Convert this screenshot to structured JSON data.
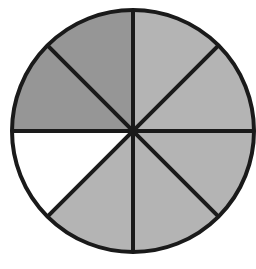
{
  "figure": {
    "kind": "fraction-circle",
    "background_color": "#ffffff"
  },
  "geometry": {
    "canvas_width": 256,
    "canvas_height": 269,
    "center_x": 133,
    "center_y": 131,
    "radius": 121,
    "outline_color": "#1a1a1a",
    "outline_width": 4,
    "divider_color": "#1a1a1a",
    "divider_width": 4,
    "sector_count": 8,
    "sector_angle_degrees": 45
  },
  "palette": {
    "dark_gray": "#969696",
    "light_gray": "#b4b4b4",
    "white": "#ffffff",
    "line_black": "#1a1a1a"
  },
  "chart_data": {
    "type": "pie",
    "xlabel": "",
    "ylabel": "",
    "legend": "none",
    "grid": false,
    "total_sectors": 8,
    "shaded_sectors": 7,
    "unshaded_sectors": 1,
    "fraction_shaded": "7/8",
    "categories": [
      "sector-1",
      "sector-2",
      "sector-3",
      "sector-4",
      "sector-5",
      "sector-6",
      "sector-7",
      "sector-8"
    ],
    "values": [
      45,
      45,
      45,
      45,
      45,
      45,
      45,
      45
    ],
    "sectors": [
      {
        "id": "sector-1",
        "label": "top-right-upper",
        "start_angle": 0,
        "end_angle": 45,
        "fill": "#b4b4b4",
        "shaded": true
      },
      {
        "id": "sector-2",
        "label": "right-upper",
        "start_angle": 45,
        "end_angle": 90,
        "fill": "#b4b4b4",
        "shaded": true
      },
      {
        "id": "sector-3",
        "label": "right-lower",
        "start_angle": 90,
        "end_angle": 135,
        "fill": "#b4b4b4",
        "shaded": true
      },
      {
        "id": "sector-4",
        "label": "bottom-right",
        "start_angle": 135,
        "end_angle": 180,
        "fill": "#b4b4b4",
        "shaded": true
      },
      {
        "id": "sector-5",
        "label": "bottom-left",
        "start_angle": 180,
        "end_angle": 225,
        "fill": "#b4b4b4",
        "shaded": true
      },
      {
        "id": "sector-6",
        "label": "left-lower",
        "start_angle": 225,
        "end_angle": 270,
        "fill": "#ffffff",
        "shaded": false
      },
      {
        "id": "sector-7",
        "label": "left-upper",
        "start_angle": 270,
        "end_angle": 315,
        "fill": "#969696",
        "shaded": true
      },
      {
        "id": "sector-8",
        "label": "top-left",
        "start_angle": 315,
        "end_angle": 360,
        "fill": "#969696",
        "shaded": true
      }
    ]
  }
}
